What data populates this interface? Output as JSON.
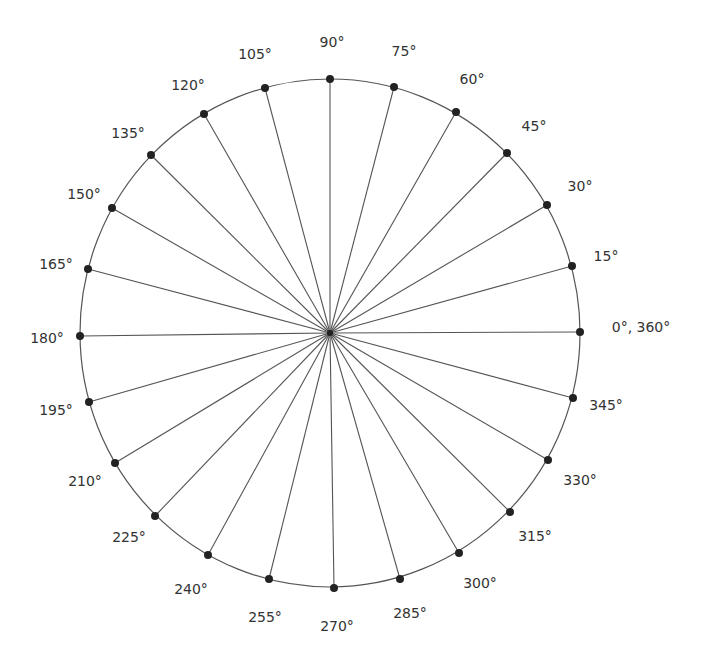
{
  "diagram": {
    "type": "unit-circle-angles",
    "center": [
      330,
      333
    ],
    "circle": {
      "cx": 330,
      "cy": 333,
      "rx": 250,
      "ry": 254,
      "stroke": "#555555"
    },
    "spoke_color": "#555555",
    "dot_color": "#222222",
    "points": [
      {
        "angle": 0,
        "label": "0°, 360°",
        "x": 580,
        "y": 332,
        "lx": 641,
        "ly": 327
      },
      {
        "angle": 15,
        "label": "15°",
        "x": 572,
        "y": 266,
        "lx": 606,
        "ly": 256
      },
      {
        "angle": 30,
        "label": "30°",
        "x": 547,
        "y": 205,
        "lx": 580,
        "ly": 186
      },
      {
        "angle": 45,
        "label": "45°",
        "x": 507,
        "y": 153,
        "lx": 534,
        "ly": 126
      },
      {
        "angle": 60,
        "label": "60°",
        "x": 456,
        "y": 112,
        "lx": 472,
        "ly": 79
      },
      {
        "angle": 75,
        "label": "75°",
        "x": 394,
        "y": 87,
        "lx": 404,
        "ly": 51
      },
      {
        "angle": 90,
        "label": "90°",
        "x": 330,
        "y": 79,
        "lx": 332,
        "ly": 42
      },
      {
        "angle": 105,
        "label": "105°",
        "x": 265,
        "y": 88,
        "lx": 255,
        "ly": 54
      },
      {
        "angle": 120,
        "label": "120°",
        "x": 204,
        "y": 114,
        "lx": 188,
        "ly": 85
      },
      {
        "angle": 135,
        "label": "135°",
        "x": 151,
        "y": 155,
        "lx": 128,
        "ly": 133
      },
      {
        "angle": 150,
        "label": "150°",
        "x": 112,
        "y": 208,
        "lx": 84,
        "ly": 194
      },
      {
        "angle": 165,
        "label": "165°",
        "x": 88,
        "y": 269,
        "lx": 56,
        "ly": 264
      },
      {
        "angle": 180,
        "label": "180°",
        "x": 80,
        "y": 336,
        "lx": 47,
        "ly": 338
      },
      {
        "angle": 195,
        "label": "195°",
        "x": 89,
        "y": 402,
        "lx": 56,
        "ly": 410
      },
      {
        "angle": 210,
        "label": "210°",
        "x": 115,
        "y": 463,
        "lx": 85,
        "ly": 481
      },
      {
        "angle": 225,
        "label": "225°",
        "x": 155,
        "y": 516,
        "lx": 129,
        "ly": 537
      },
      {
        "angle": 240,
        "label": "240°",
        "x": 208,
        "y": 555,
        "lx": 191,
        "ly": 589
      },
      {
        "angle": 255,
        "label": "255°",
        "x": 269,
        "y": 579,
        "lx": 265,
        "ly": 617
      },
      {
        "angle": 270,
        "label": "270°",
        "x": 334,
        "y": 588,
        "lx": 337,
        "ly": 626
      },
      {
        "angle": 285,
        "label": "285°",
        "x": 400,
        "y": 579,
        "lx": 410,
        "ly": 613
      },
      {
        "angle": 300,
        "label": "300°",
        "x": 459,
        "y": 553,
        "lx": 480,
        "ly": 583
      },
      {
        "angle": 315,
        "label": "315°",
        "x": 510,
        "y": 512,
        "lx": 535,
        "ly": 536
      },
      {
        "angle": 330,
        "label": "330°",
        "x": 548,
        "y": 460,
        "lx": 580,
        "ly": 480
      },
      {
        "angle": 345,
        "label": "345°",
        "x": 573,
        "y": 398,
        "lx": 606,
        "ly": 405
      }
    ]
  }
}
